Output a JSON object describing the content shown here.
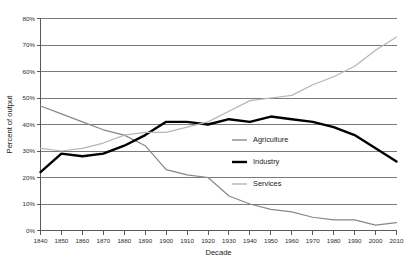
{
  "chart_data": {
    "type": "line",
    "title": "",
    "xlabel": "Decade",
    "ylabel": "Percent of output",
    "xlim": [
      1840,
      2010
    ],
    "ylim": [
      0,
      80
    ],
    "grid": "horizontal",
    "legend_position": "center-right",
    "x": [
      1840,
      1850,
      1860,
      1870,
      1880,
      1890,
      1900,
      1910,
      1920,
      1930,
      1940,
      1950,
      1960,
      1970,
      1980,
      1990,
      2000,
      2010
    ],
    "xtick_labels": [
      "1840",
      "1850",
      "1860",
      "1870",
      "1880",
      "1890",
      "1900",
      "1910",
      "1920",
      "1930",
      "1940",
      "1950",
      "1960",
      "1970",
      "1980",
      "1990",
      "2000",
      "2010"
    ],
    "ytick_labels": [
      "0%",
      "10%",
      "20%",
      "30%",
      "40%",
      "50%",
      "60%",
      "70%",
      "80%"
    ],
    "ytick_values": [
      0,
      10,
      20,
      30,
      40,
      50,
      60,
      70,
      80
    ],
    "series": [
      {
        "name": "Agriculture",
        "color": "#888888",
        "width": 1.2,
        "values": [
          47,
          44,
          41,
          38,
          36,
          32,
          23,
          21,
          20,
          13,
          10,
          8,
          7,
          5,
          4,
          4,
          2,
          3
        ]
      },
      {
        "name": "Industry",
        "color": "#000000",
        "width": 2.4,
        "values": [
          22,
          29,
          28,
          29,
          32,
          36,
          41,
          41,
          40,
          42,
          41,
          43,
          42,
          41,
          39,
          36,
          31,
          26
        ]
      },
      {
        "name": "Services",
        "color": "#b5b5b5",
        "width": 1.2,
        "values": [
          31,
          30,
          31,
          33,
          36,
          37,
          37,
          39,
          41,
          45,
          49,
          50,
          51,
          55,
          58,
          62,
          68,
          73
        ]
      }
    ]
  },
  "legend": {
    "items": [
      {
        "label": "Agriculture",
        "color": "#888888",
        "width": 1.4
      },
      {
        "label": "Industry",
        "color": "#000000",
        "width": 2.4
      },
      {
        "label": "Services",
        "color": "#b5b5b5",
        "width": 1.4
      }
    ]
  }
}
